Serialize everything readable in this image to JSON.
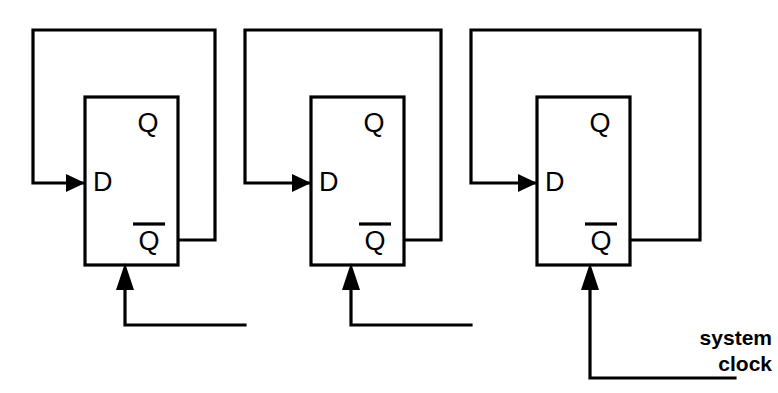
{
  "diagram": {
    "stroke_color": "#000000",
    "background_color": "#ffffff",
    "canvas": {
      "width": 778,
      "height": 393
    }
  },
  "labels": {
    "clock_line1": "system",
    "clock_line2": "clock"
  },
  "stages": [
    {
      "id": "stage-1",
      "d_label": "D",
      "q_label": "Q",
      "qbar_label": "Q",
      "qbar_has_overbar": true,
      "box": {
        "x": 85,
        "y": 97,
        "width": 93,
        "height": 168
      },
      "d_pin": {
        "x": 85,
        "y": 183
      },
      "q_pin": {
        "x": 148,
        "y": 125
      },
      "qbar_pin": {
        "x": 148,
        "y": 243
      },
      "qbar_out": {
        "x": 178,
        "y": 240
      },
      "clk_pin": {
        "x": 125,
        "y": 265
      },
      "feedback": {
        "right_x": 215,
        "top_y": 30,
        "left_x": 33,
        "enter_y": 183
      },
      "clock_branch": {
        "down_y": 325,
        "right_x": 245
      }
    },
    {
      "id": "stage-2",
      "d_label": "D",
      "q_label": "Q",
      "qbar_label": "Q",
      "qbar_has_overbar": true,
      "box": {
        "x": 311,
        "y": 97,
        "width": 93,
        "height": 168
      },
      "d_pin": {
        "x": 311,
        "y": 183
      },
      "q_pin": {
        "x": 374,
        "y": 125
      },
      "qbar_pin": {
        "x": 374,
        "y": 243
      },
      "qbar_out": {
        "x": 404,
        "y": 240
      },
      "clk_pin": {
        "x": 351,
        "y": 265
      },
      "feedback": {
        "right_x": 441,
        "top_y": 30,
        "left_x": 245,
        "enter_y": 183
      },
      "clock_branch": {
        "down_y": 325,
        "right_x": 471
      }
    },
    {
      "id": "stage-3",
      "d_label": "D",
      "q_label": "Q",
      "qbar_label": "Q",
      "qbar_has_overbar": true,
      "box": {
        "x": 537,
        "y": 97,
        "width": 93,
        "height": 168
      },
      "d_pin": {
        "x": 537,
        "y": 183
      },
      "q_pin": {
        "x": 600,
        "y": 125
      },
      "qbar_pin": {
        "x": 600,
        "y": 243
      },
      "qbar_out": {
        "x": 630,
        "y": 240
      },
      "clk_pin": {
        "x": 590,
        "y": 265
      },
      "feedback": {
        "right_x": 700,
        "top_y": 30,
        "left_x": 471,
        "enter_y": 183
      },
      "clock_branch": {
        "down_y": 378,
        "right_x": 735
      }
    }
  ],
  "clock_net": {
    "source_x": 735,
    "source_y": 378,
    "riser_x": 590,
    "target_y": 265
  }
}
